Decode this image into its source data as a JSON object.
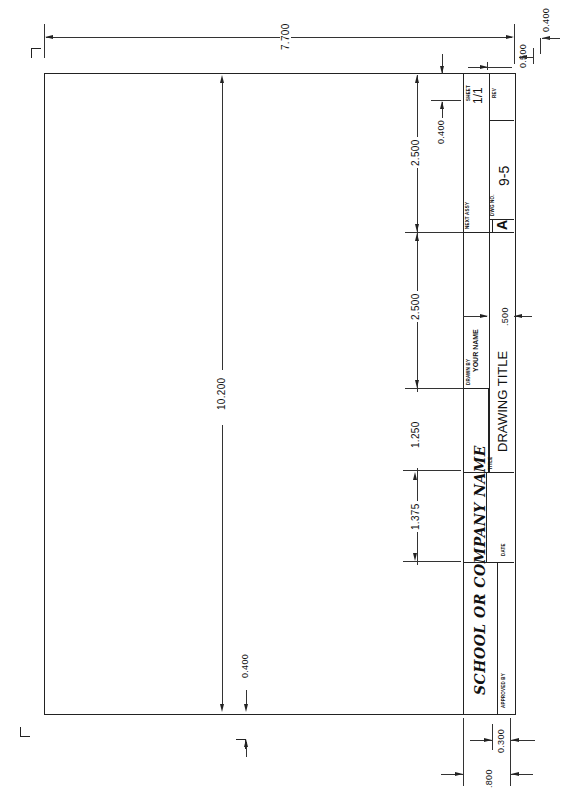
{
  "drawing": {
    "orientation": "rotated -90deg (landscape sheet shown in portrait)",
    "title_block": {
      "sheet_label": "SHEET",
      "sheet_value": "1/1",
      "rev_label": "REV",
      "next_assy_label": "NEXT ASSY",
      "size_value": "A",
      "dwg_no_label": "DWG NO.",
      "dwg_no_value": "9-5",
      "drawn_by_label": "DRAWN BY",
      "drawn_by_value": "YOUR NAME",
      "title_label": "TITLE",
      "title_value": "DRAWING TITLE",
      "company_value": "SCHOOL OR COMPANY NAME",
      "date_label": "DATE",
      "approved_by_label": "APPROVED BY"
    },
    "dimensions": {
      "overall_width": "7.700",
      "overall_length": "10.200",
      "top_margin": "0.500",
      "top_offset": "0.400",
      "sheet_block_height": "0.400",
      "segment_1": "2.500",
      "segment_2": "2.500",
      "segment_3": "1.250",
      "segment_4": "1.375",
      "title_row_height": ".500",
      "left_margin": "0.400",
      "bottom_block_width": ".800",
      "bottom_strip_width": "0.300"
    }
  }
}
